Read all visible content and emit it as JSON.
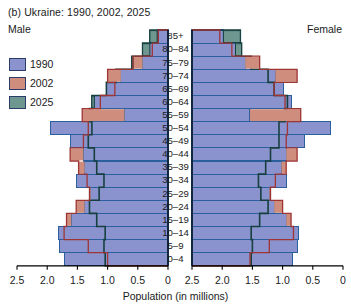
{
  "chart_data": {
    "type": "bar",
    "subtype": "population-pyramid",
    "title": "(b)  Ukraine: 1990, 2002, 2025",
    "xlabel": "Population (in millions)",
    "ylabel": "",
    "left_panel_label": "Male",
    "right_panel_label": "Female",
    "xlim": [
      0,
      2.5
    ],
    "xticks": [
      2.5,
      2.0,
      1.5,
      1.0,
      0.5,
      0
    ],
    "xticklabels_left": [
      "2.5",
      "2.0",
      "1.5",
      "1.0",
      "0.5",
      "0"
    ],
    "xticklabels_right": [
      "0",
      "0.5",
      "1.0",
      "1.5",
      "2.0",
      "2.5"
    ],
    "grid": false,
    "legend_position": "upper-left",
    "categories": [
      "85+",
      "80–84",
      "75–79",
      "70–74",
      "65–69",
      "60–64",
      "55–59",
      "50–54",
      "45–49",
      "40–44",
      "35–39",
      "30–34",
      "25–29",
      "20–24",
      "15–19",
      "10–14",
      "5–9",
      "0–4"
    ],
    "colors": {
      "1990": "#8b93ce",
      "2002": "#cf8d7e",
      "2025": "#6e9790",
      "1990_edge": "#2c5f9e",
      "2002_edge": "#9e3535",
      "2025_edge": "#16403f"
    },
    "series": [
      {
        "name": "1990",
        "male": [
          0.18,
          0.3,
          0.42,
          0.78,
          1.02,
          1.22,
          0.72,
          1.95,
          1.62,
          1.4,
          1.38,
          1.52,
          1.28,
          1.38,
          1.6,
          1.82,
          1.8,
          1.72
        ],
        "female": [
          0.52,
          0.72,
          0.88,
          1.38,
          1.52,
          1.64,
          0.96,
          2.3,
          1.86,
          1.56,
          1.48,
          1.56,
          1.28,
          1.36,
          1.56,
          1.76,
          1.74,
          1.66
        ]
      },
      {
        "name": "2002",
        "male": [
          0.16,
          0.26,
          0.58,
          1.0,
          0.88,
          1.12,
          1.42,
          1.32,
          1.4,
          1.62,
          1.48,
          1.34,
          1.3,
          1.52,
          1.68,
          1.72,
          1.32,
          1.0
        ],
        "female": [
          0.46,
          0.66,
          1.12,
          1.74,
          1.36,
          1.54,
          1.8,
          1.58,
          1.56,
          1.74,
          1.56,
          1.38,
          1.3,
          1.5,
          1.64,
          1.68,
          1.28,
          0.96
        ]
      },
      {
        "name": "2025",
        "male": [
          0.3,
          0.42,
          0.6,
          0.86,
          1.02,
          1.26,
          1.3,
          1.26,
          1.32,
          1.22,
          1.18,
          1.06,
          1.14,
          1.3,
          1.18,
          1.04,
          1.06,
          1.04
        ],
        "female": [
          0.8,
          0.82,
          0.98,
          1.26,
          1.36,
          1.58,
          1.54,
          1.44,
          1.44,
          1.3,
          1.22,
          1.1,
          1.14,
          1.26,
          1.12,
          0.98,
          1.0,
          0.98
        ]
      }
    ]
  },
  "legend": {
    "items": [
      {
        "label": "1990",
        "color": "#8b93ce"
      },
      {
        "label": "2002",
        "color": "#cf8d7e"
      },
      {
        "label": "2025",
        "color": "#6e9790"
      }
    ]
  }
}
